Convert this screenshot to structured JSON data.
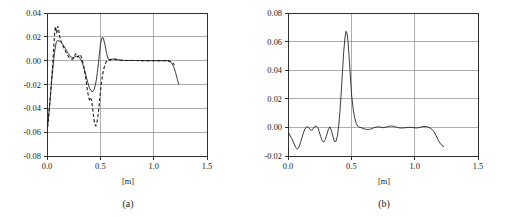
{
  "figure": {
    "panel_a_caption": "(a)",
    "panel_b_caption": "(b)"
  },
  "chart_data": [
    {
      "id": "panel-a",
      "type": "line",
      "title": "",
      "subtitle": "",
      "caption": "(a)",
      "xlabel": "[m]",
      "ylabel": "",
      "xlim": [
        0.0,
        1.5
      ],
      "ylim": [
        -0.08,
        0.04
      ],
      "xticks": [
        0.0,
        0.5,
        1.0,
        1.5
      ],
      "xtick_labels": [
        "0.0",
        "0.5",
        "1.0",
        "1.5"
      ],
      "yticks": [
        0.04,
        0.02,
        0.0,
        -0.02,
        -0.04,
        -0.06,
        -0.08
      ],
      "ytick_labels": [
        "0.04",
        "0.02",
        "0.00",
        "-0.02",
        "-0.04",
        "-0.06",
        "-0.08"
      ],
      "grid": "horizontal-and-vertical",
      "legend": "none",
      "series": [
        {
          "name": "solid",
          "style": "solid",
          "color": "#1a1a1a",
          "x": [
            0.005,
            0.01,
            0.016,
            0.022,
            0.028,
            0.034,
            0.04,
            0.048,
            0.056,
            0.064,
            0.072,
            0.08,
            0.088,
            0.096,
            0.104,
            0.112,
            0.122,
            0.132,
            0.142,
            0.152,
            0.162,
            0.172,
            0.182,
            0.192,
            0.202,
            0.212,
            0.222,
            0.232,
            0.242,
            0.252,
            0.262,
            0.272,
            0.282,
            0.292,
            0.302,
            0.312,
            0.322,
            0.332,
            0.342,
            0.352,
            0.362,
            0.372,
            0.382,
            0.392,
            0.402,
            0.412,
            0.422,
            0.432,
            0.442,
            0.452,
            0.462,
            0.472,
            0.482,
            0.492,
            0.502,
            0.515,
            0.528,
            0.542,
            0.556,
            0.57,
            0.59,
            0.61,
            0.635,
            0.66,
            0.69,
            0.72,
            0.75,
            0.79,
            0.83,
            0.87,
            0.91,
            0.95,
            0.99,
            1.03,
            1.07,
            1.1,
            1.125,
            1.145,
            1.16,
            1.175,
            1.19,
            1.205,
            1.22,
            1.235
          ],
          "y": [
            -0.056,
            -0.052,
            -0.046,
            -0.04,
            -0.034,
            -0.0275,
            -0.021,
            -0.013,
            -0.0055,
            0.0015,
            0.0075,
            0.0125,
            0.0158,
            0.0168,
            0.0168,
            0.0166,
            0.0162,
            0.0156,
            0.0145,
            0.0132,
            0.0118,
            0.0102,
            0.0086,
            0.007,
            0.0056,
            0.0044,
            0.0034,
            0.0028,
            0.0026,
            0.0028,
            0.0032,
            0.0036,
            0.0038,
            0.0036,
            0.0028,
            0.0016,
            0.0,
            -0.0022,
            -0.0048,
            -0.0078,
            -0.0112,
            -0.0148,
            -0.0182,
            -0.0212,
            -0.0236,
            -0.0252,
            -0.026,
            -0.0256,
            -0.024,
            -0.021,
            -0.0164,
            -0.01,
            -0.0024,
            0.0062,
            0.014,
            0.0192,
            0.019,
            0.014,
            0.0072,
            0.0022,
            0.0,
            0.0012,
            0.0016,
            0.001,
            0.0004,
            0.0002,
            0.0002,
            0.0002,
            0.0001,
            0.0001,
            0.0001,
            0.0,
            0.0,
            0.0,
            0.0,
            0.0,
            0.0,
            -0.0002,
            -0.001,
            -0.0028,
            -0.0058,
            -0.0098,
            -0.015,
            -0.0198
          ]
        },
        {
          "name": "dashed",
          "style": "dashed",
          "color": "#1a1a1a",
          "x": [
            0.005,
            0.012,
            0.02,
            0.028,
            0.036,
            0.044,
            0.052,
            0.06,
            0.066,
            0.072,
            0.078,
            0.084,
            0.09,
            0.096,
            0.102,
            0.108,
            0.114,
            0.12,
            0.128,
            0.138,
            0.148,
            0.158,
            0.168,
            0.178,
            0.188,
            0.198,
            0.208,
            0.218,
            0.228,
            0.238,
            0.248,
            0.258,
            0.268,
            0.278,
            0.288,
            0.298,
            0.308,
            0.318,
            0.328,
            0.338,
            0.348,
            0.358,
            0.368,
            0.378,
            0.388,
            0.398,
            0.408,
            0.418,
            0.428,
            0.438,
            0.448,
            0.458,
            0.468,
            0.478,
            0.488,
            0.498,
            0.51,
            0.525,
            0.54,
            0.556,
            0.572,
            0.592,
            0.615,
            0.645,
            0.68,
            0.72,
            0.76,
            0.8,
            0.85,
            0.9,
            0.95,
            1.0,
            1.05,
            1.09,
            1.12,
            1.15,
            1.175,
            1.195
          ],
          "y": [
            -0.056,
            -0.05,
            -0.042,
            -0.0335,
            -0.0245,
            -0.015,
            -0.0055,
            0.006,
            0.015,
            0.0235,
            0.0285,
            0.0268,
            0.0228,
            0.025,
            0.0288,
            0.0272,
            0.0232,
            0.0196,
            0.017,
            0.0148,
            0.0128,
            0.0108,
            0.0088,
            0.007,
            0.0054,
            0.004,
            0.0028,
            0.002,
            0.0014,
            0.0012,
            0.002,
            0.004,
            0.0058,
            0.005,
            0.003,
            0.0038,
            0.0052,
            0.004,
            0.0014,
            -0.002,
            -0.0066,
            -0.012,
            -0.018,
            -0.0242,
            -0.0296,
            -0.033,
            -0.031,
            -0.033,
            -0.04,
            -0.048,
            -0.0536,
            -0.0548,
            -0.052,
            -0.046,
            -0.038,
            -0.029,
            -0.0186,
            -0.01,
            -0.0042,
            -0.001,
            0.0004,
            0.001,
            0.0012,
            0.0008,
            0.0004,
            0.0002,
            0.0002,
            0.0001,
            0.0001,
            0.0,
            0.0,
            0.0,
            0.0,
            0.0,
            0.0,
            -0.0004,
            -0.0016,
            -0.0034
          ]
        }
      ]
    },
    {
      "id": "panel-b",
      "type": "line",
      "title": "",
      "subtitle": "",
      "caption": "(b)",
      "xlabel": "[m]",
      "ylabel": "",
      "xlim": [
        0.0,
        1.5
      ],
      "ylim": [
        -0.02,
        0.08
      ],
      "xticks": [
        0.0,
        0.5,
        1.0,
        1.5
      ],
      "xtick_labels": [
        "0.0",
        "0.5",
        "1.0",
        "1.5"
      ],
      "yticks": [
        0.08,
        0.06,
        0.04,
        0.02,
        0.0,
        -0.02
      ],
      "ytick_labels": [
        "0.08",
        "0.06",
        "0.04",
        "0.02",
        "0.00",
        "-0.02"
      ],
      "grid": "horizontal-and-vertical",
      "legend": "none",
      "series": [
        {
          "name": "solid",
          "style": "solid",
          "color": "#1a1a1a",
          "x": [
            0.005,
            0.018,
            0.032,
            0.046,
            0.06,
            0.074,
            0.086,
            0.098,
            0.11,
            0.124,
            0.138,
            0.15,
            0.162,
            0.174,
            0.186,
            0.198,
            0.21,
            0.222,
            0.234,
            0.246,
            0.258,
            0.27,
            0.282,
            0.294,
            0.306,
            0.318,
            0.33,
            0.342,
            0.354,
            0.366,
            0.378,
            0.39,
            0.4,
            0.41,
            0.42,
            0.43,
            0.44,
            0.45,
            0.458,
            0.466,
            0.474,
            0.482,
            0.492,
            0.502,
            0.514,
            0.526,
            0.54,
            0.554,
            0.568,
            0.584,
            0.6,
            0.62,
            0.642,
            0.664,
            0.686,
            0.708,
            0.73,
            0.752,
            0.774,
            0.796,
            0.818,
            0.84,
            0.862,
            0.884,
            0.906,
            0.928,
            0.95,
            0.972,
            0.994,
            1.016,
            1.04,
            1.065,
            1.09,
            1.112,
            1.132,
            1.15,
            1.168,
            1.185,
            1.2,
            1.215,
            1.23
          ],
          "y": [
            -0.0038,
            -0.006,
            -0.008,
            -0.011,
            -0.014,
            -0.0152,
            -0.0138,
            -0.0108,
            -0.0072,
            -0.0032,
            -0.0004,
            0.0006,
            0.0,
            -0.0014,
            -0.002,
            -0.001,
            0.0006,
            0.001,
            0.0,
            -0.0028,
            -0.0064,
            -0.0094,
            -0.0102,
            -0.0086,
            -0.0052,
            -0.0016,
            0.0004,
            -0.0018,
            -0.0062,
            -0.0096,
            -0.01,
            -0.006,
            0.001,
            0.011,
            0.024,
            0.039,
            0.053,
            0.063,
            0.0672,
            0.066,
            0.06,
            0.05,
            0.036,
            0.0228,
            0.013,
            0.0068,
            0.0026,
            0.0006,
            0.0,
            -0.0004,
            -0.001,
            -0.0014,
            -0.0014,
            -0.0008,
            0.0,
            0.0004,
            0.0002,
            -0.0002,
            0.0002,
            0.0008,
            0.001,
            0.0006,
            0.0,
            -0.0004,
            -0.0004,
            -0.0002,
            0.0,
            0.0,
            -0.0002,
            -0.0004,
            0.0,
            0.0006,
            0.0006,
            0.0,
            -0.001,
            -0.0028,
            -0.0056,
            -0.0086,
            -0.011,
            -0.0126,
            -0.0134
          ]
        }
      ]
    }
  ]
}
